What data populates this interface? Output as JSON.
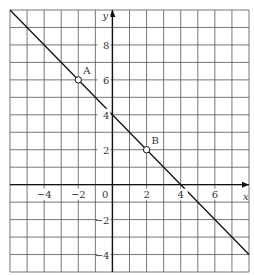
{
  "graph": {
    "x_range": [
      -6,
      8
    ],
    "y_range": [
      -5,
      10
    ],
    "x_axis_label": "x",
    "y_axis_label": "y",
    "x_ticks": [
      {
        "v": -4,
        "t": "−4"
      },
      {
        "v": -2,
        "t": "−2"
      },
      {
        "v": 2,
        "t": "2"
      },
      {
        "v": 4,
        "t": "4"
      },
      {
        "v": 6,
        "t": "6"
      }
    ],
    "y_ticks": [
      {
        "v": 8,
        "t": "8"
      },
      {
        "v": 6,
        "t": "6"
      },
      {
        "v": 4,
        "t": "4"
      },
      {
        "v": 2,
        "t": "2"
      },
      {
        "v": -2,
        "t": "−2"
      },
      {
        "v": -4,
        "t": "−4"
      }
    ],
    "origin_label": "0",
    "line": {
      "from": [
        -6,
        10
      ],
      "to": [
        8,
        -4
      ],
      "equation": "y = 4 - x"
    },
    "points": [
      {
        "label": "A",
        "x": -2,
        "y": 6
      },
      {
        "label": "B",
        "x": 2,
        "y": 2
      }
    ]
  }
}
